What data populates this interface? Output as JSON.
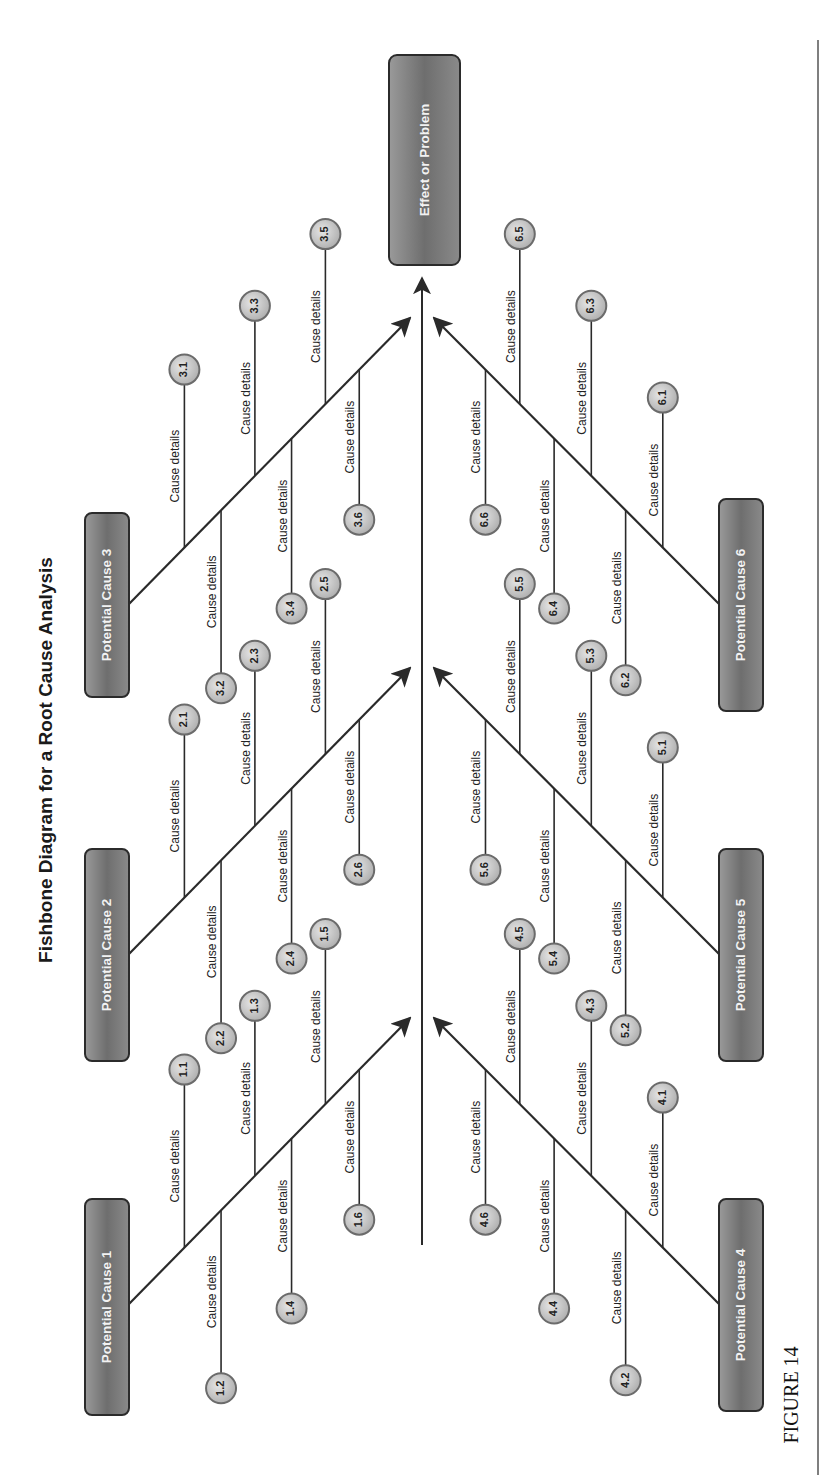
{
  "diagram": {
    "title": "Fishbone Diagram for a Root Cause Analysis",
    "effect": "Effect or Problem",
    "figure_label": "FIGURE 14",
    "orientation": "rotated 90° counter-clockwise",
    "colors": {
      "box_fill": "#7a7a7a",
      "box_border": "#2b2b2b",
      "box_text": "#f2f2f2",
      "circle_fill": "#cfcfcf",
      "circle_border": "#6b6b6b",
      "line": "#2a2a2a"
    },
    "causes": [
      {
        "id": 1,
        "label": "Potential Cause 1",
        "side": "top",
        "details": [
          {
            "num": "1.1",
            "text": "Cause details"
          },
          {
            "num": "1.2",
            "text": "Cause details"
          },
          {
            "num": "1.3",
            "text": "Cause details"
          },
          {
            "num": "1.4",
            "text": "Cause details"
          },
          {
            "num": "1.5",
            "text": "Cause details"
          },
          {
            "num": "1.6",
            "text": "Cause details"
          }
        ]
      },
      {
        "id": 2,
        "label": "Potential Cause 2",
        "side": "top",
        "details": [
          {
            "num": "2.1",
            "text": "Cause details"
          },
          {
            "num": "2.2",
            "text": "Cause details"
          },
          {
            "num": "2.3",
            "text": "Cause details"
          },
          {
            "num": "2.4",
            "text": "Cause details"
          },
          {
            "num": "2.5",
            "text": "Cause details"
          },
          {
            "num": "2.6",
            "text": "Cause details"
          }
        ]
      },
      {
        "id": 3,
        "label": "Potential Cause 3",
        "side": "top",
        "details": [
          {
            "num": "3.1",
            "text": "Cause details"
          },
          {
            "num": "3.2",
            "text": "Cause details"
          },
          {
            "num": "3.3",
            "text": "Cause details"
          },
          {
            "num": "3.4",
            "text": "Cause details"
          },
          {
            "num": "3.5",
            "text": "Cause details"
          },
          {
            "num": "3.6",
            "text": "Cause details"
          }
        ]
      },
      {
        "id": 4,
        "label": "Potential Cause 4",
        "side": "bottom",
        "details": [
          {
            "num": "4.1",
            "text": "Cause details"
          },
          {
            "num": "4.2",
            "text": "Cause details"
          },
          {
            "num": "4.3",
            "text": "Cause details"
          },
          {
            "num": "4.4",
            "text": "Cause details"
          },
          {
            "num": "4.5",
            "text": "Cause details"
          },
          {
            "num": "4.6",
            "text": "Cause details"
          }
        ]
      },
      {
        "id": 5,
        "label": "Potential Cause 5",
        "side": "bottom",
        "details": [
          {
            "num": "5.1",
            "text": "Cause details"
          },
          {
            "num": "5.2",
            "text": "Cause details"
          },
          {
            "num": "5.3",
            "text": "Cause details"
          },
          {
            "num": "5.4",
            "text": "Cause details"
          },
          {
            "num": "5.5",
            "text": "Cause details"
          },
          {
            "num": "5.6",
            "text": "Cause details"
          }
        ]
      },
      {
        "id": 6,
        "label": "Potential Cause 6",
        "side": "bottom",
        "details": [
          {
            "num": "6.1",
            "text": "Cause details"
          },
          {
            "num": "6.2",
            "text": "Cause details"
          },
          {
            "num": "6.3",
            "text": "Cause details"
          },
          {
            "num": "6.4",
            "text": "Cause details"
          },
          {
            "num": "6.5",
            "text": "Cause details"
          },
          {
            "num": "6.6",
            "text": "Cause details"
          }
        ]
      }
    ]
  }
}
